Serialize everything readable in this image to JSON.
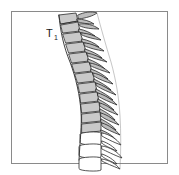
{
  "figure": {
    "kind": "anatomical-line-drawing",
    "background_color": "#ffffff",
    "frame": {
      "name": "figure-border",
      "stroke_color": "#8a8a8a",
      "stroke_width": 1,
      "x": 11,
      "y": 11,
      "width": 156,
      "height": 152
    },
    "labels": [
      {
        "id": "t1",
        "base": "T",
        "subscript": "1",
        "full_text": "T1",
        "x": 46,
        "y": 35,
        "color": "#1a1a1a"
      }
    ],
    "colors": {
      "outline": "#2b2b2b",
      "thoracic_body_fill": "#c9c9c9",
      "thoracic_process_fill": "#bdbdbd",
      "lumbar_body_fill": "#ffffff",
      "disc_fill": "#e8e8e8",
      "hatch": "#7d7d7d"
    },
    "anatomy": {
      "region_upper": "thoracic",
      "region_lower": "lumbar",
      "curvature": "kyphotic (posteriorly convex thoracic curve)",
      "thoracic_vertebra_count": 12,
      "lumbar_vertebra_count": 3,
      "thoracic_shaded": true,
      "lumbar_shaded": false,
      "orientation": "lateral, anterior to the left, posterior to the right",
      "vertebrae": [
        {
          "id": "T1",
          "type": "thoracic",
          "shaded": true,
          "cx": 67,
          "cy": 22
        },
        {
          "id": "T2",
          "type": "thoracic",
          "shaded": true,
          "cx": 69,
          "cy": 31
        },
        {
          "id": "T3",
          "type": "thoracic",
          "shaded": true,
          "cx": 71,
          "cy": 40
        },
        {
          "id": "T4",
          "type": "thoracic",
          "shaded": true,
          "cx": 74,
          "cy": 49
        },
        {
          "id": "T5",
          "type": "thoracic",
          "shaded": true,
          "cx": 77,
          "cy": 58
        },
        {
          "id": "T6",
          "type": "thoracic",
          "shaded": true,
          "cx": 80,
          "cy": 67
        },
        {
          "id": "T7",
          "type": "thoracic",
          "shaded": true,
          "cx": 83,
          "cy": 76
        },
        {
          "id": "T8",
          "type": "thoracic",
          "shaded": true,
          "cx": 86,
          "cy": 85
        },
        {
          "id": "T9",
          "type": "thoracic",
          "shaded": true,
          "cx": 88,
          "cy": 94
        },
        {
          "id": "T10",
          "type": "thoracic",
          "shaded": true,
          "cx": 90,
          "cy": 103
        },
        {
          "id": "T11",
          "type": "thoracic",
          "shaded": true,
          "cx": 91,
          "cy": 112
        },
        {
          "id": "T12",
          "type": "thoracic",
          "shaded": true,
          "cx": 91,
          "cy": 121
        },
        {
          "id": "L1",
          "type": "lumbar",
          "shaded": false,
          "cx": 90,
          "cy": 132
        },
        {
          "id": "L2",
          "type": "lumbar",
          "shaded": false,
          "cx": 90,
          "cy": 145
        },
        {
          "id": "L3",
          "type": "lumbar",
          "shaded": false,
          "cx": 90,
          "cy": 158
        }
      ]
    }
  }
}
